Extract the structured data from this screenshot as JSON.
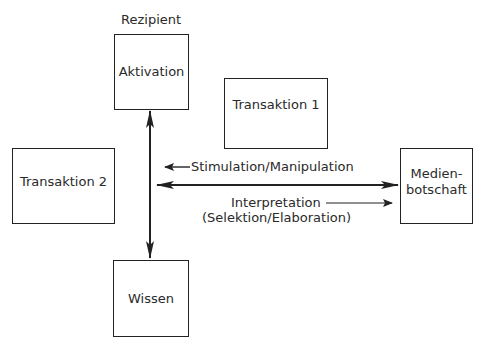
{
  "diagram": {
    "title_label": "Rezipient",
    "nodes": {
      "aktivation": {
        "label": "Aktivation"
      },
      "wissen": {
        "label": "Wissen"
      },
      "transaktion1": {
        "label": "Transaktion 1"
      },
      "transaktion2": {
        "label": "Transaktion 2"
      },
      "medienbotschaft": {
        "label_line1": "Medien-",
        "label_line2": "botschaft"
      }
    },
    "edges": {
      "stimulation": {
        "label": "Stimulation/Manipulation"
      },
      "interpretation": {
        "label_line1": "Interpretation",
        "label_line2": "(Selektion/Elaboration)"
      },
      "aktivation_wissen": {
        "label": ""
      },
      "rezipient_medienbotschaft": {
        "label": ""
      }
    },
    "colors": {
      "line": "#222222",
      "text": "#2a2a2a",
      "background": "#ffffff"
    }
  }
}
